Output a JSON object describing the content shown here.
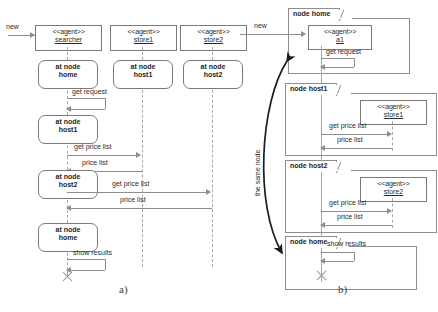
{
  "figure": {
    "captions": {
      "left": "a)",
      "right": "b)"
    }
  },
  "diagram_a": {
    "creation_message": "new",
    "lifelines": [
      {
        "stereotype": "<<agent>>",
        "name": "searcher"
      },
      {
        "stereotype": "<<agent>>",
        "name": "store1"
      },
      {
        "stereotype": "<<agent>>",
        "name": "store2"
      }
    ],
    "states": [
      {
        "line1": "at node",
        "line2": "home"
      },
      {
        "line1": "at node",
        "line2": "host1"
      },
      {
        "line1": "at node",
        "line2": "host2"
      },
      {
        "line1": "at node",
        "line2": "host1"
      },
      {
        "line1": "at node",
        "line2": "host2"
      },
      {
        "line1": "at node",
        "line2": "home"
      }
    ],
    "messages": {
      "get_request": "get request",
      "get_price_list": "get price list",
      "price_list": "price list",
      "show_results": "show results"
    }
  },
  "diagram_b": {
    "creation_message": "new",
    "same_node_label": "the same node",
    "nodes": [
      {
        "title": "node home"
      },
      {
        "title": "node host1"
      },
      {
        "title": "node host2"
      },
      {
        "title": "node home"
      }
    ],
    "agents": [
      {
        "stereotype": "<<agent>>",
        "name": "a1"
      },
      {
        "stereotype": "<<agent>>",
        "name": "store1"
      },
      {
        "stereotype": "<<agent>>",
        "name": "store2"
      }
    ],
    "messages": {
      "get_request": "get request",
      "get_price_list": "get price list",
      "price_list": "price list",
      "show_results": "show results"
    }
  }
}
